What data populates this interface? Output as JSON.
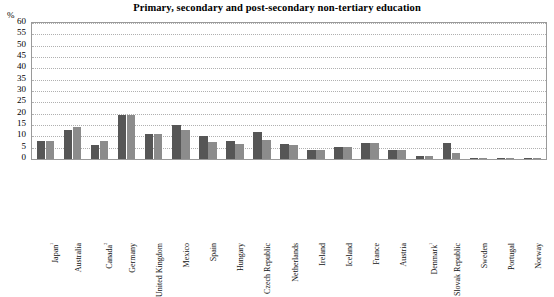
{
  "chart_data": {
    "type": "bar",
    "title": "Primary, secondary and post-secondary non-tertiary education",
    "xlabel": "",
    "ylabel": "%",
    "ylim": [
      0,
      60
    ],
    "yticks": [
      0,
      5,
      10,
      15,
      20,
      25,
      30,
      35,
      40,
      45,
      50,
      55,
      60
    ],
    "grid": true,
    "legend": "none",
    "categories": [
      "Japan¹",
      "Australia",
      "Canada²",
      "Germany",
      "United Kingdom",
      "Mexico",
      "Spain",
      "Hungary",
      "Czech Republic",
      "Netherlands",
      "Ireland",
      "Iceland",
      "France",
      "Austria",
      "Denmark¹",
      "Slovak Republic",
      "Sweden",
      "Portugal",
      "Norway"
    ],
    "series": [
      {
        "name": "series-1",
        "color": "#565656",
        "values": [
          8,
          13,
          6,
          19.5,
          11,
          15,
          10,
          8,
          12,
          6.5,
          4,
          5.5,
          7,
          4,
          1.5,
          7,
          0.2,
          0.2,
          0.5
        ]
      },
      {
        "name": "series-2",
        "color": "#8c8c8c",
        "values": [
          8,
          14,
          8,
          19.5,
          11,
          13,
          7.5,
          6.5,
          8.5,
          6,
          4,
          5.5,
          7,
          4,
          1.5,
          2.5,
          0.2,
          0.2,
          0.5
        ]
      }
    ]
  },
  "axis": {
    "unit_label": "%"
  }
}
